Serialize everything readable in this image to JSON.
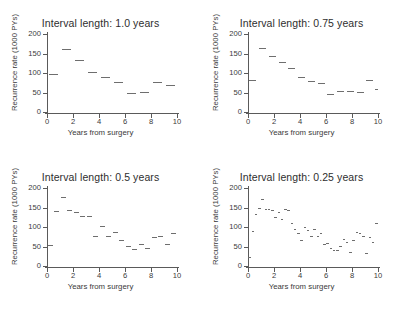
{
  "figure": {
    "background": "#ffffff",
    "ink_color": "#5a5a5a",
    "marker_color": "#6e6e6e",
    "panel_count": 4
  },
  "axes": {
    "xlabel": "Years from surgery",
    "ylabel": "Recurrence rate (1000 PYs)",
    "xticks": [
      0,
      2,
      4,
      6,
      8,
      10
    ],
    "yticks": [
      0,
      50,
      100,
      150,
      200
    ],
    "xlim": [
      0,
      10
    ],
    "ylim": [
      0,
      200
    ]
  },
  "panels": [
    {
      "title": "Interval length: 1.0 years",
      "interval": 1.0
    },
    {
      "title": "Interval length: 0.75 years",
      "interval": 0.75
    },
    {
      "title": "Interval length: 0.5 years",
      "interval": 0.5
    },
    {
      "title": "Interval length: 0.25 years",
      "interval": 0.25
    }
  ],
  "chart_data": [
    {
      "type": "bar",
      "title": "Interval length: 1.0 years",
      "xlabel": "Years from surgery",
      "ylabel": "Recurrence rate (1000 PYs)",
      "xlim": [
        0,
        10
      ],
      "ylim": [
        0,
        200
      ],
      "xticks": [
        0,
        2,
        4,
        6,
        8,
        10
      ],
      "yticks": [
        0,
        50,
        100,
        150,
        200
      ],
      "grid": false,
      "legend": false,
      "interval_length": 1.0,
      "style": "piecewise-constant horizontal segments",
      "x_starts": [
        0,
        1,
        2,
        3,
        4,
        5,
        6,
        7,
        8,
        9
      ],
      "x_ends": [
        1,
        2,
        3,
        4,
        5,
        6,
        7,
        8,
        9,
        10
      ],
      "values": [
        97,
        161,
        133,
        103,
        90,
        78,
        48,
        52,
        78,
        70
      ]
    },
    {
      "type": "bar",
      "title": "Interval length: 0.75 years",
      "xlabel": "Years from surgery",
      "ylabel": "Recurrence rate (1000 PYs)",
      "xlim": [
        0,
        10
      ],
      "ylim": [
        0,
        200
      ],
      "xticks": [
        0,
        2,
        4,
        6,
        8,
        10
      ],
      "yticks": [
        0,
        50,
        100,
        150,
        200
      ],
      "grid": false,
      "legend": false,
      "interval_length": 0.75,
      "style": "piecewise-constant horizontal segments",
      "x_starts": [
        0,
        0.75,
        1.5,
        2.25,
        3,
        3.75,
        4.5,
        5.25,
        6,
        6.75,
        7.5,
        8.25,
        9,
        9.75
      ],
      "x_ends": [
        0.75,
        1.5,
        2.25,
        3,
        3.75,
        4.5,
        5.25,
        6,
        6.75,
        7.5,
        8.25,
        9,
        9.75,
        10
      ],
      "values": [
        81,
        165,
        143,
        129,
        112,
        90,
        79,
        74,
        47,
        54,
        53,
        51,
        82,
        58
      ]
    },
    {
      "type": "bar",
      "title": "Interval length: 0.5 years",
      "xlabel": "Years from surgery",
      "ylabel": "Recurrence rate (1000 PYs)",
      "xlim": [
        0,
        10
      ],
      "ylim": [
        0,
        200
      ],
      "xticks": [
        0,
        2,
        4,
        6,
        8,
        10
      ],
      "yticks": [
        0,
        50,
        100,
        150,
        200
      ],
      "grid": false,
      "legend": false,
      "interval_length": 0.5,
      "style": "piecewise-constant horizontal segments",
      "x_starts": [
        0,
        0.5,
        1,
        1.5,
        2,
        2.5,
        3,
        3.5,
        4,
        4.5,
        5,
        5.5,
        6,
        6.5,
        7,
        7.5,
        8,
        8.5,
        9,
        9.5
      ],
      "x_ends": [
        0.5,
        1,
        1.5,
        2,
        2.5,
        3,
        3.5,
        4,
        4.5,
        5,
        5.5,
        6,
        6.5,
        7,
        7.5,
        8,
        8.5,
        9,
        9.5,
        10
      ],
      "values": [
        55,
        140,
        176,
        144,
        139,
        128,
        127,
        76,
        102,
        76,
        87,
        66,
        52,
        44,
        57,
        45,
        75,
        78,
        57,
        85
      ]
    },
    {
      "type": "bar",
      "title": "Interval length: 0.25 years",
      "xlabel": "Years from surgery",
      "ylabel": "Recurrence rate (1000 PYs)",
      "xlim": [
        0,
        10
      ],
      "ylim": [
        0,
        200
      ],
      "xticks": [
        0,
        2,
        4,
        6,
        8,
        10
      ],
      "yticks": [
        0,
        50,
        100,
        150,
        200
      ],
      "grid": false,
      "legend": false,
      "interval_length": 0.25,
      "style": "piecewise-constant horizontal segments",
      "x_starts": [
        0,
        0.25,
        0.5,
        0.75,
        1,
        1.25,
        1.5,
        1.75,
        2,
        2.25,
        2.5,
        2.75,
        3,
        3.25,
        3.5,
        3.75,
        4,
        4.25,
        4.5,
        4.75,
        5,
        5.25,
        5.5,
        5.75,
        6,
        6.25,
        6.5,
        6.75,
        7,
        7.25,
        7.5,
        7.75,
        8,
        8.25,
        8.5,
        8.75,
        9,
        9.25,
        9.5,
        9.75
      ],
      "x_ends": [
        0.25,
        0.5,
        0.75,
        1,
        1.25,
        1.5,
        1.75,
        2,
        2.25,
        2.5,
        2.75,
        3,
        3.25,
        3.5,
        3.75,
        4,
        4.25,
        4.5,
        4.75,
        5,
        5.25,
        5.5,
        5.75,
        6,
        6.25,
        6.5,
        6.75,
        7,
        7.25,
        7.5,
        7.75,
        8,
        8.25,
        8.5,
        8.75,
        9,
        9.25,
        9.5,
        9.75,
        10
      ],
      "values": [
        22,
        90,
        134,
        148,
        172,
        147,
        147,
        143,
        126,
        138,
        120,
        145,
        143,
        109,
        96,
        85,
        67,
        101,
        93,
        78,
        94,
        76,
        85,
        57,
        58,
        45,
        40,
        40,
        52,
        69,
        62,
        37,
        67,
        88,
        85,
        78,
        33,
        74,
        62,
        109
      ]
    }
  ]
}
